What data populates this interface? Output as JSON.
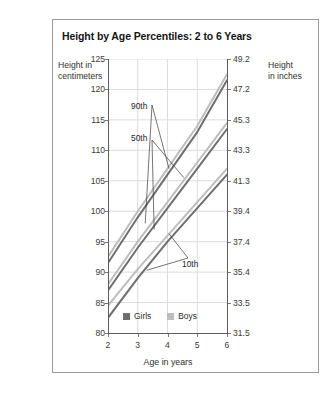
{
  "title": "Height by Age Percentiles: 2 to 6 Years",
  "axis": {
    "left_caption": "Height in\ncentimeters",
    "left_caption_line1": "Height in",
    "left_caption_line2": "centimeters",
    "right_caption_line1": "Height",
    "right_caption_line2": "in inches",
    "x_caption": "Age in years"
  },
  "legend": {
    "items": [
      {
        "label": "Girls",
        "color": "#6e6e6e"
      },
      {
        "label": "Boys",
        "color": "#bdbdbd"
      }
    ]
  },
  "annotations": [
    {
      "name": "90th",
      "label": "90th"
    },
    {
      "name": "50th",
      "label": "50th"
    },
    {
      "name": "10th",
      "label": "10th"
    }
  ],
  "colors": {
    "girls": "#6e6e6e",
    "boys": "#bdbdbd",
    "grid": "#dcdcdc",
    "axis": "#5d5d5d",
    "frame": "#9a9a9a",
    "text": "#303030"
  },
  "chart_data": {
    "type": "line",
    "title": "Height by Age Percentiles: 2 to 6 Years",
    "xlabel": "Age in years",
    "ylabel": "Height in centimeters",
    "ylabel_secondary": "Height in inches",
    "xlim": [
      2,
      6
    ],
    "ylim": [
      80,
      125
    ],
    "ylim_secondary": [
      31.5,
      49.2
    ],
    "grid": true,
    "legend_position": "bottom-center",
    "x": [
      2,
      3,
      4,
      5,
      6
    ],
    "xticks": [
      2,
      3,
      4,
      5,
      6
    ],
    "xticklabels": [
      "2",
      "3",
      "4",
      "5",
      "6"
    ],
    "yticks": [
      80,
      85,
      90,
      95,
      100,
      105,
      110,
      115,
      120,
      125
    ],
    "yticklabels": [
      "80",
      "85",
      "90",
      "95",
      "100",
      "105",
      "110",
      "115",
      "120",
      "125"
    ],
    "yticks_secondary": [
      31.5,
      33.5,
      35.4,
      37.4,
      39.4,
      41.3,
      43.3,
      45.3,
      47.2,
      49.2
    ],
    "yticklabels_secondary": [
      "31.5",
      "33.5",
      "35.4",
      "37.4",
      "39.4",
      "41.3",
      "43.3",
      "45.3",
      "47.2",
      "49.2"
    ],
    "series": [
      {
        "name": "Girls 90th",
        "group": "Girls",
        "percentile": "90th",
        "color": "#6e6e6e",
        "values": [
          91.5,
          99.0,
          106.0,
          113.0,
          121.5
        ]
      },
      {
        "name": "Boys 90th",
        "group": "Boys",
        "percentile": "90th",
        "color": "#bdbdbd",
        "values": [
          92.5,
          100.0,
          107.0,
          114.0,
          122.5
        ]
      },
      {
        "name": "Girls 50th",
        "group": "Girls",
        "percentile": "50th",
        "color": "#6e6e6e",
        "values": [
          87.0,
          94.0,
          100.5,
          107.0,
          113.5
        ]
      },
      {
        "name": "Boys 50th",
        "group": "Boys",
        "percentile": "50th",
        "color": "#bdbdbd",
        "values": [
          88.0,
          95.0,
          101.5,
          108.0,
          114.5
        ]
      },
      {
        "name": "Girls 10th",
        "group": "Girls",
        "percentile": "10th",
        "color": "#6e6e6e",
        "values": [
          82.5,
          89.0,
          95.0,
          100.5,
          106.0
        ]
      },
      {
        "name": "Boys 10th",
        "group": "Boys",
        "percentile": "10th",
        "color": "#bdbdbd",
        "values": [
          84.5,
          90.5,
          96.0,
          101.5,
          107.0
        ]
      }
    ]
  }
}
